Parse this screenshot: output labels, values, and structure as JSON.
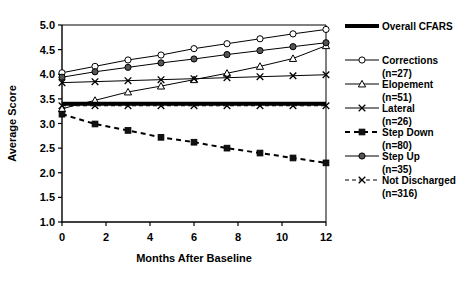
{
  "chart_data": {
    "type": "line",
    "title": "",
    "xlabel": "Months After Baseline",
    "ylabel": "Average Score",
    "xlim": [
      0,
      12
    ],
    "ylim": [
      1.0,
      5.0
    ],
    "xticks": [
      0,
      2,
      4,
      6,
      8,
      10,
      12
    ],
    "xtick_labels": [
      "0",
      "2",
      "4",
      "6",
      "8",
      "10",
      "12"
    ],
    "yticks": [
      1.0,
      1.5,
      2.0,
      2.5,
      3.0,
      3.5,
      4.0,
      4.5,
      5.0
    ],
    "ytick_labels": [
      "1.0",
      "1.5",
      "2.0",
      "2.5",
      "3.0",
      "3.5",
      "4.0",
      "4.5",
      "5.0"
    ],
    "grid": false,
    "legend_position": "right",
    "x": [
      0,
      1.5,
      3,
      4.5,
      6,
      7.5,
      9,
      10.5,
      12
    ],
    "series": [
      {
        "name": "Overall CFARS",
        "label": "Overall CFARS",
        "n_label": "",
        "marker": "none",
        "dash": "solid",
        "width": 4,
        "values": [
          3.4,
          3.4,
          3.4,
          3.4,
          3.4,
          3.4,
          3.4,
          3.4,
          3.4
        ]
      },
      {
        "name": "Corrections",
        "label": "Corrections",
        "n_label": "(n=27)",
        "marker": "open-circle",
        "dash": "solid",
        "width": 1,
        "values": [
          4.03,
          4.16,
          4.29,
          4.39,
          4.52,
          4.62,
          4.72,
          4.82,
          4.91
        ]
      },
      {
        "name": "Elopement",
        "label": "Elopement",
        "n_label": "(n=51)",
        "marker": "open-triangle",
        "dash": "solid",
        "width": 1,
        "values": [
          3.3,
          3.47,
          3.64,
          3.76,
          3.89,
          4.02,
          4.16,
          4.32,
          4.58
        ]
      },
      {
        "name": "Lateral",
        "label": "Lateral",
        "n_label": "(n=26)",
        "marker": "cross-x",
        "dash": "solid",
        "width": 1,
        "values": [
          3.83,
          3.85,
          3.87,
          3.89,
          3.91,
          3.93,
          3.95,
          3.97,
          3.99
        ]
      },
      {
        "name": "Step Down",
        "label": "Step Down",
        "n_label": "(n=80)",
        "marker": "filled-square",
        "dash": "dashed",
        "width": 2,
        "values": [
          3.19,
          2.99,
          2.86,
          2.72,
          2.62,
          2.5,
          2.4,
          2.3,
          2.2
        ]
      },
      {
        "name": "Step Up",
        "label": "Step Up",
        "n_label": "(n=35)",
        "marker": "filled-circle",
        "dash": "solid",
        "width": 1,
        "values": [
          3.94,
          4.05,
          4.14,
          4.23,
          4.31,
          4.4,
          4.48,
          4.56,
          4.64
        ]
      },
      {
        "name": "Not Discharged",
        "label": "Not Discharged",
        "n_label": "(n=316)",
        "marker": "cross-x",
        "dash": "dashed",
        "width": 1,
        "values": [
          3.36,
          3.36,
          3.36,
          3.36,
          3.36,
          3.36,
          3.36,
          3.36,
          3.36
        ]
      }
    ]
  },
  "colors": {
    "axis": "#000000",
    "line": "#000000",
    "background": "#ffffff"
  }
}
